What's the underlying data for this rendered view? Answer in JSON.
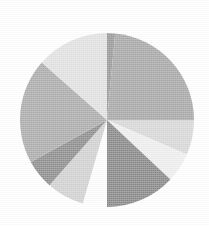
{
  "chart_data": {
    "type": "pie",
    "title": "",
    "subtitle": "",
    "xlabel": "",
    "ylabel": "",
    "grid": false,
    "legend": "none",
    "labels_shown": false,
    "start_angle_deg": 0,
    "direction": "clockwise",
    "center": {
      "x": 107,
      "y": 120
    },
    "radius": 87,
    "total": 100,
    "categories": [
      "Slice 1",
      "Slice 2",
      "Slice 3",
      "Slice 4",
      "Slice 5",
      "Slice 6",
      "Slice 7",
      "Slice 8",
      "Slice 9",
      "Slice 10"
    ],
    "values": [
      1.5,
      23.5,
      6.5,
      5.5,
      13.0,
      4.5,
      7.0,
      5.5,
      19.5,
      13.5
    ],
    "colors": [
      "#9a9a9a",
      "#a9a9a9",
      "#d9d9d9",
      "#efefef",
      "#8a8a8a",
      "#fdfdfd",
      "#d2d2d2",
      "#8f8f8f",
      "#adadad",
      "#e2e2e2"
    ],
    "slices": [
      {
        "label": "Slice 1",
        "value": 1.5,
        "start_deg": 0.0,
        "end_deg": 5.4,
        "color": "#9a9a9a"
      },
      {
        "label": "Slice 2",
        "value": 23.5,
        "start_deg": 5.4,
        "end_deg": 90.0,
        "color": "#a9a9a9"
      },
      {
        "label": "Slice 3",
        "value": 6.5,
        "start_deg": 90.0,
        "end_deg": 113.4,
        "color": "#d9d9d9"
      },
      {
        "label": "Slice 4",
        "value": 5.5,
        "start_deg": 113.4,
        "end_deg": 133.2,
        "color": "#efefef"
      },
      {
        "label": "Slice 5",
        "value": 13.0,
        "start_deg": 133.2,
        "end_deg": 180.0,
        "color": "#8a8a8a"
      },
      {
        "label": "Slice 6",
        "value": 4.5,
        "start_deg": 180.0,
        "end_deg": 196.2,
        "color": "#fdfdfd"
      },
      {
        "label": "Slice 7",
        "value": 7.0,
        "start_deg": 196.2,
        "end_deg": 221.4,
        "color": "#d2d2d2"
      },
      {
        "label": "Slice 8",
        "value": 5.5,
        "start_deg": 221.4,
        "end_deg": 241.2,
        "color": "#8f8f8f"
      },
      {
        "label": "Slice 9",
        "value": 19.5,
        "start_deg": 241.2,
        "end_deg": 311.4,
        "color": "#adadad"
      },
      {
        "label": "Slice 10",
        "value": 13.5,
        "start_deg": 311.4,
        "end_deg": 360.0,
        "color": "#e2e2e2"
      }
    ],
    "background_color": "#ffffff"
  },
  "figure": {
    "alt_text": "Grayscale pie chart with ten wedges"
  }
}
